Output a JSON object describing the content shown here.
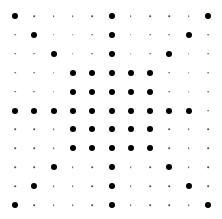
{
  "diagram": {
    "type": "dot-grid",
    "rows": 11,
    "cols": 11,
    "origin": {
      "x": 15,
      "y": 16
    },
    "step": {
      "x": 19.3,
      "y": 18.9
    },
    "colors": {
      "big": "#000000",
      "small": "#555555",
      "background": "#ffffff"
    },
    "pattern": [
      "X....X....X",
      ".X...X...X.",
      "..X..X..X..",
      "...XXXXX...",
      "...XXXXX...",
      "XXXXXXXXXX.",
      "...XXXXX...",
      "...XXXXX...",
      "..X..X..X..",
      ".X...X...X.",
      "X....X....X"
    ]
  }
}
